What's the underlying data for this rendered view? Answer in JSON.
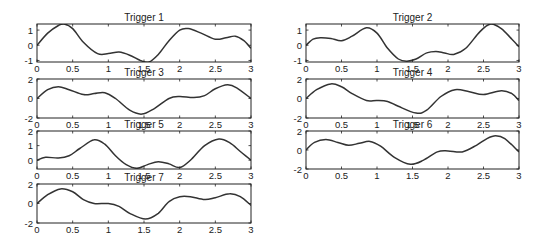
{
  "figure": {
    "background": "#ffffff",
    "line_color": "#333333"
  },
  "chart_data": [
    {
      "type": "line",
      "title": "Trigger 1",
      "xlim": [
        0,
        3
      ],
      "ylim": [
        -1.1,
        1.4
      ],
      "xticks": [
        0,
        0.5,
        1,
        1.5,
        2,
        2.5,
        3
      ],
      "xtick_labels": [
        "0",
        "0.5",
        "1",
        "1.5",
        "2",
        "2.5",
        "3"
      ],
      "yticks": [
        -1,
        0,
        1
      ],
      "ytick_labels": [
        "-1",
        "0",
        "1"
      ],
      "x": [
        0,
        0.15,
        0.3,
        0.38,
        0.5,
        0.65,
        0.85,
        1.0,
        1.15,
        1.3,
        1.45,
        1.57,
        1.7,
        1.85,
        2.0,
        2.12,
        2.3,
        2.5,
        2.65,
        2.78,
        2.9,
        3.0
      ],
      "y": [
        0,
        0.8,
        1.3,
        1.4,
        1.1,
        0.2,
        -0.55,
        -0.55,
        -0.45,
        -0.65,
        -1.0,
        -1.1,
        -0.6,
        0.3,
        1.0,
        1.1,
        0.8,
        0.4,
        0.5,
        0.6,
        0.3,
        -0.2
      ]
    },
    {
      "type": "line",
      "title": "Trigger 2",
      "xlim": [
        0,
        3
      ],
      "ylim": [
        -1.1,
        1.4
      ],
      "xticks": [
        0,
        0.5,
        1,
        1.5,
        2,
        2.5,
        3
      ],
      "xtick_labels": [
        "0",
        "0.5",
        "1",
        "1.5",
        "2",
        "2.5",
        "3"
      ],
      "yticks": [
        -1,
        0,
        1
      ],
      "ytick_labels": [
        "-1",
        "0",
        "1"
      ],
      "x": [
        0,
        0.1,
        0.2,
        0.35,
        0.5,
        0.65,
        0.85,
        1.0,
        1.15,
        1.3,
        1.42,
        1.55,
        1.7,
        1.83,
        1.95,
        2.08,
        2.25,
        2.45,
        2.6,
        2.75,
        2.9,
        3.0
      ],
      "y": [
        0,
        0.4,
        0.5,
        0.45,
        0.3,
        0.6,
        1.15,
        0.8,
        -0.2,
        -0.9,
        -1.05,
        -0.9,
        -0.5,
        -0.4,
        -0.5,
        -0.6,
        -0.2,
        0.9,
        1.4,
        1.1,
        0.4,
        -0.1
      ]
    },
    {
      "type": "line",
      "title": "Trigger 3",
      "xlim": [
        0,
        3
      ],
      "ylim": [
        -2,
        2
      ],
      "xticks": [
        0,
        0.5,
        1,
        1.5,
        2,
        2.5,
        3
      ],
      "xtick_labels": [
        "0",
        "0.5",
        "1",
        "1.5",
        "2",
        "2.5",
        "3"
      ],
      "yticks": [
        -2,
        0,
        2
      ],
      "ytick_labels": [
        "-2",
        "0",
        "2"
      ],
      "x": [
        0,
        0.15,
        0.3,
        0.45,
        0.65,
        0.8,
        0.95,
        1.1,
        1.3,
        1.47,
        1.65,
        1.85,
        2.0,
        2.2,
        2.35,
        2.5,
        2.67,
        2.8,
        3.0
      ],
      "y": [
        0,
        0.9,
        1.2,
        0.9,
        0.4,
        0.5,
        0.6,
        0.0,
        -1.2,
        -1.6,
        -1.0,
        0.0,
        0.2,
        0.1,
        0.3,
        1.0,
        1.4,
        1.1,
        0.0
      ]
    },
    {
      "type": "line",
      "title": "Trigger 4",
      "xlim": [
        0,
        3
      ],
      "ylim": [
        -2,
        2
      ],
      "xticks": [
        0,
        0.5,
        1,
        1.5,
        2,
        2.5,
        3
      ],
      "xtick_labels": [
        "0",
        "0.5",
        "1",
        "1.5",
        "2",
        "2.5",
        "3"
      ],
      "yticks": [
        -2,
        0,
        2
      ],
      "ytick_labels": [
        "-2",
        "0",
        "2"
      ],
      "x": [
        0,
        0.15,
        0.35,
        0.5,
        0.65,
        0.85,
        1.0,
        1.15,
        1.3,
        1.55,
        1.7,
        1.9,
        2.1,
        2.3,
        2.5,
        2.75,
        2.9,
        3.0
      ],
      "y": [
        0,
        0.9,
        1.5,
        1.2,
        0.5,
        -0.2,
        -0.2,
        -0.3,
        -0.8,
        -1.5,
        -1.2,
        0.2,
        0.9,
        0.7,
        0.4,
        0.8,
        0.5,
        -0.2
      ]
    },
    {
      "type": "line",
      "title": "Trigger 5",
      "xlim": [
        0,
        3
      ],
      "ylim": [
        -0.6,
        2
      ],
      "xticks": [
        0,
        0.5,
        1,
        1.5,
        2,
        2.5,
        3
      ],
      "xtick_labels": [
        "0",
        "0.5",
        "1",
        "1.5",
        "2",
        "2.5",
        "3"
      ],
      "yticks": [
        0,
        1,
        2
      ],
      "ytick_labels": [
        "0",
        "1",
        "2"
      ],
      "x": [
        0,
        0.12,
        0.3,
        0.45,
        0.6,
        0.8,
        0.95,
        1.1,
        1.25,
        1.4,
        1.55,
        1.7,
        1.85,
        2.0,
        2.15,
        2.35,
        2.55,
        2.7,
        2.85,
        3.0
      ],
      "y": [
        0,
        0.2,
        0.15,
        0.3,
        0.8,
        1.4,
        1.1,
        0.3,
        -0.3,
        -0.55,
        -0.3,
        -0.1,
        -0.25,
        -0.5,
        0.0,
        1.0,
        1.45,
        1.2,
        0.6,
        0.0
      ]
    },
    {
      "type": "line",
      "title": "Trigger 6",
      "xlim": [
        0,
        3
      ],
      "ylim": [
        -2,
        2
      ],
      "xticks": [
        0,
        0.5,
        1,
        1.5,
        2,
        2.5,
        3
      ],
      "xtick_labels": [
        "0",
        "0.5",
        "1",
        "1.5",
        "2",
        "2.5",
        "3"
      ],
      "yticks": [
        -2,
        0,
        2
      ],
      "ytick_labels": [
        "-2",
        "0",
        "2"
      ],
      "x": [
        0,
        0.12,
        0.28,
        0.45,
        0.6,
        0.75,
        0.9,
        1.05,
        1.25,
        1.47,
        1.65,
        1.85,
        2.0,
        2.2,
        2.4,
        2.55,
        2.67,
        2.8,
        3.0
      ],
      "y": [
        0,
        0.8,
        1.1,
        0.8,
        0.5,
        0.7,
        0.9,
        0.4,
        -0.8,
        -1.5,
        -1.1,
        -0.2,
        -0.1,
        -0.2,
        0.5,
        1.2,
        1.5,
        1.2,
        -0.2
      ]
    },
    {
      "type": "line",
      "title": "Trigger 7",
      "xlim": [
        0,
        3
      ],
      "ylim": [
        -2,
        2
      ],
      "xticks": [
        0,
        0.5,
        1,
        1.5,
        2,
        2.5,
        3
      ],
      "xtick_labels": [
        "0",
        "0.5",
        "1",
        "1.5",
        "2",
        "2.5",
        "3"
      ],
      "yticks": [
        -2,
        0,
        2
      ],
      "ytick_labels": [
        "-2",
        "0",
        "2"
      ],
      "x": [
        0,
        0.15,
        0.33,
        0.5,
        0.65,
        0.8,
        1.0,
        1.15,
        1.3,
        1.52,
        1.7,
        1.85,
        2.0,
        2.15,
        2.35,
        2.5,
        2.7,
        2.85,
        3.0
      ],
      "y": [
        0,
        0.9,
        1.5,
        1.2,
        0.4,
        0.0,
        0.0,
        -0.3,
        -1.0,
        -1.6,
        -1.0,
        0.2,
        0.7,
        0.7,
        0.4,
        0.6,
        1.0,
        0.7,
        -0.2
      ]
    }
  ]
}
